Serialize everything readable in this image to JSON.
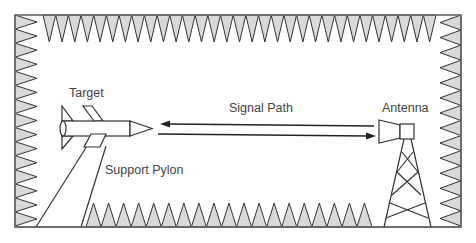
{
  "diagram": {
    "labels": {
      "target": "Target",
      "signal_path": "Signal Path",
      "antenna": "Antenna",
      "support_pylon": "Support Pylon"
    },
    "colors": {
      "stroke": "#333333",
      "absorber_fill": "#d9d9d9",
      "frame": "#555555",
      "text": "#444444",
      "background": "#ffffff"
    },
    "absorbers": {
      "top_count": 31,
      "left_count": 15,
      "right_count": 14,
      "bottom_count": 19
    }
  }
}
